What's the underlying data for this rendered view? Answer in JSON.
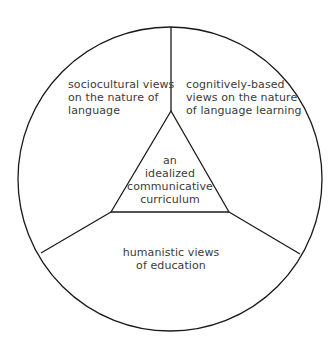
{
  "diagram": {
    "colors": {
      "line": "#1a1a1a",
      "text": "#3a3a3a",
      "background": "#ffffff"
    },
    "circle": {
      "cx": 170,
      "cy": 179,
      "r": 152
    },
    "triangle": {
      "apex": [
        171,
        111
      ],
      "left": [
        111,
        212
      ],
      "right": [
        229,
        212
      ]
    },
    "dividers": [
      {
        "from": [
          171,
          111
        ],
        "to": [
          171,
          27
        ]
      },
      {
        "from": [
          111,
          212
        ],
        "to": [
          41,
          253
        ]
      },
      {
        "from": [
          229,
          212
        ],
        "to": [
          300,
          254
        ]
      }
    ],
    "segments": {
      "top_left": {
        "lines": [
          "sociocultural views",
          "on the nature of",
          "language"
        ]
      },
      "top_right": {
        "lines": [
          "cognitively-based",
          "views on the nature",
          "of language learning"
        ]
      },
      "bottom": {
        "lines": [
          "humanistic views",
          "of education"
        ]
      },
      "center": {
        "lines": [
          "an",
          "idealized",
          "communicative",
          "curriculum"
        ]
      }
    }
  }
}
